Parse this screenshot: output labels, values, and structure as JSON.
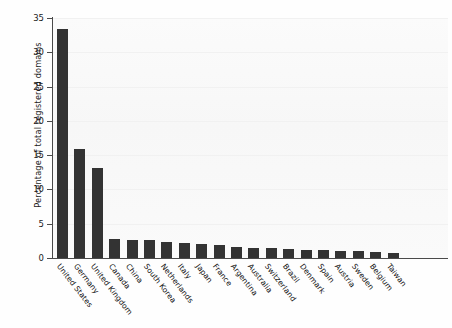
{
  "chart_data": {
    "type": "bar",
    "title": "",
    "xlabel": "",
    "ylabel": "Percentage of total registered domains",
    "ylim": [
      0,
      35
    ],
    "yticks": [
      0,
      5,
      10,
      15,
      20,
      25,
      30,
      35
    ],
    "ytick_labels": [
      "0",
      "5",
      "10",
      "15",
      "20",
      "25",
      "30",
      "35"
    ],
    "grid": true,
    "legend": "none",
    "bar_color": "#333333",
    "plot_background": "#f8f8f8",
    "categories": [
      "United States",
      "Germany",
      "United Kingdom",
      "Canada",
      "China",
      "South Korea",
      "Netherlands",
      "Italy",
      "Japan",
      "France",
      "Argentina",
      "Australia",
      "Switzerland",
      "Brazil",
      "Denmark",
      "Spain",
      "Austria",
      "Sweden",
      "Belgium",
      "Taiwan"
    ],
    "values": [
      33.4,
      15.9,
      13.1,
      2.8,
      2.7,
      2.7,
      2.4,
      2.2,
      2.0,
      1.9,
      1.6,
      1.5,
      1.4,
      1.3,
      1.2,
      1.1,
      1.0,
      1.0,
      0.9,
      0.7
    ]
  }
}
